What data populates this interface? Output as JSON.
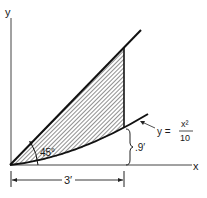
{
  "axes": {
    "x_label": "x",
    "y_label": "y"
  },
  "annotations": {
    "angle_label": "45°",
    "height_label": ".9′",
    "width_label": "3′",
    "curve_eq_lhs": "y =",
    "curve_eq_num": "x²",
    "curve_eq_den": "10"
  },
  "colors": {
    "stroke": "#1a1a1a",
    "hatch": "#333333",
    "background": "#ffffff"
  }
}
